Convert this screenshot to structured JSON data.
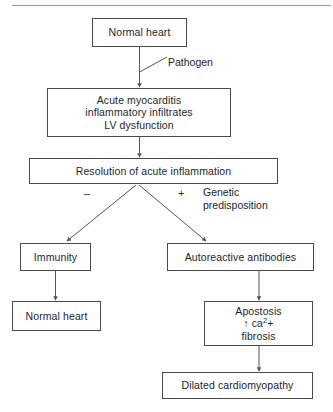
{
  "diagram": {
    "topRuleColor": "#9a9a9a",
    "boxBorderColor": "#4a4a4a",
    "lineColor": "#555555",
    "textColor": "#1f1f1f",
    "background": "#fefefe",
    "nodes": {
      "normal_heart_top": {
        "text": "Normal heart"
      },
      "acute_myocarditis": {
        "line1": "Acute myocarditis",
        "line2": "inflammatory infiltrates",
        "line3": "LV dysfunction"
      },
      "resolution": {
        "text": "Resolution of acute inflammation"
      },
      "immunity": {
        "text": "Immunity"
      },
      "autoreactive_antibodies": {
        "text": "Autoreactive antibodies"
      },
      "normal_heart_bottom": {
        "text": "Normal heart"
      },
      "apostosis": {
        "line1": "Apostosis",
        "line2_prefix": "↑ ca",
        "line2_sup": "2",
        "line2_suffix": "+",
        "line3": "fibrosis"
      },
      "dilated_cardiomyopathy": {
        "text": "Dilated cardiomyopathy"
      }
    },
    "edge_labels": {
      "pathogen": "Pathogen",
      "genetic_line1": "Genetic",
      "genetic_line2": "predisposition",
      "minus_sign": "–",
      "plus_sign": "+"
    }
  }
}
